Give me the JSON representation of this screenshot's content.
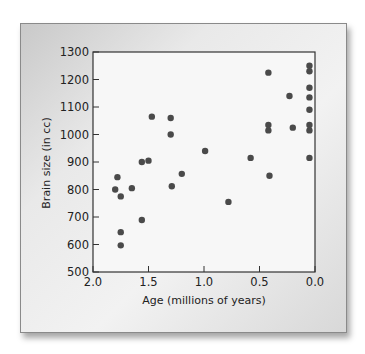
{
  "chart_data": {
    "type": "scatter",
    "title": "",
    "xlabel": "Age (millions of years)",
    "ylabel": "Brain size (in cc)",
    "xlim": [
      2.0,
      0.0
    ],
    "ylim": [
      500,
      1300
    ],
    "x_reversed": true,
    "grid": false,
    "legend": null,
    "xticks": [
      2.0,
      1.5,
      1.0,
      0.5,
      0.0
    ],
    "xtick_labels": [
      "2.0",
      "1.5",
      "1.0",
      "0.5",
      "0.0"
    ],
    "yticks": [
      500,
      600,
      700,
      800,
      900,
      1000,
      1100,
      1200,
      1300
    ],
    "ytick_labels": [
      "500",
      "600",
      "700",
      "800",
      "900",
      "1000",
      "1100",
      "1200",
      "1300"
    ],
    "marker_color": "#4a4a4a",
    "points": [
      {
        "x": 1.8,
        "y": 800
      },
      {
        "x": 1.78,
        "y": 845
      },
      {
        "x": 1.75,
        "y": 775
      },
      {
        "x": 1.75,
        "y": 645
      },
      {
        "x": 1.75,
        "y": 597
      },
      {
        "x": 1.65,
        "y": 805
      },
      {
        "x": 1.56,
        "y": 900
      },
      {
        "x": 1.56,
        "y": 689
      },
      {
        "x": 1.5,
        "y": 905
      },
      {
        "x": 1.47,
        "y": 1065
      },
      {
        "x": 1.3,
        "y": 1060
      },
      {
        "x": 1.3,
        "y": 1000
      },
      {
        "x": 1.29,
        "y": 812
      },
      {
        "x": 1.2,
        "y": 857
      },
      {
        "x": 0.99,
        "y": 940
      },
      {
        "x": 0.78,
        "y": 755
      },
      {
        "x": 0.58,
        "y": 915
      },
      {
        "x": 0.42,
        "y": 1225
      },
      {
        "x": 0.42,
        "y": 1035
      },
      {
        "x": 0.42,
        "y": 1015
      },
      {
        "x": 0.41,
        "y": 850
      },
      {
        "x": 0.23,
        "y": 1140
      },
      {
        "x": 0.2,
        "y": 1025
      },
      {
        "x": 0.05,
        "y": 1250
      },
      {
        "x": 0.05,
        "y": 1230
      },
      {
        "x": 0.05,
        "y": 1170
      },
      {
        "x": 0.05,
        "y": 1135
      },
      {
        "x": 0.05,
        "y": 1090
      },
      {
        "x": 0.05,
        "y": 1035
      },
      {
        "x": 0.05,
        "y": 1015
      },
      {
        "x": 0.05,
        "y": 915
      }
    ]
  }
}
